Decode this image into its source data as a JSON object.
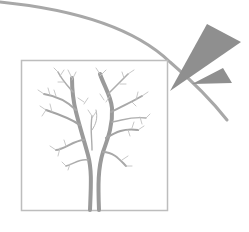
{
  "illustration": {
    "subject": "bare tree in square frame with arc and lightning wedges",
    "colors": {
      "background": "#ffffff",
      "frame": "#bdbdbd",
      "arc": "#a8a8a8",
      "wedge": "#8f8f8f",
      "tree": "#9a9a9a",
      "branches": "#b5b5b5"
    },
    "icons": [
      "tree-icon",
      "lightning-wedge-icon",
      "arc-line"
    ]
  }
}
